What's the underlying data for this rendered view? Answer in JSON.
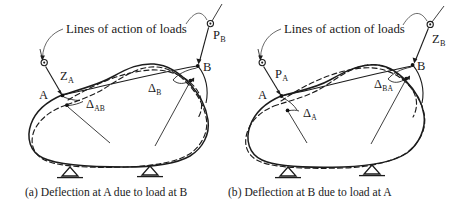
{
  "figure": {
    "kind": "engineering-diagram",
    "topic": "Maxwell's reciprocal theorem / Betti's law — deflection reciprocity",
    "background_color": "#ffffff",
    "ink_color": "#1c1c1c",
    "panels": [
      {
        "id": "a",
        "caption": "(a) Deflection at A due to load at B",
        "annotation_header": "Lines of action of loads",
        "labels": {
          "point_a": "A",
          "point_b": "B",
          "force_left_base": "Z",
          "force_left_sub": "A",
          "force_right_base": "P",
          "force_right_sub": "B",
          "deflection_left_base": "Δ",
          "deflection_left_sub": "AB",
          "deflection_right_base": "Δ",
          "deflection_right_sub": "B"
        },
        "legend": {
          "solid": "undeformed body outline",
          "dashed": "deformed body outline"
        },
        "supports": 2
      },
      {
        "id": "b",
        "caption": "(b) Deflection at B due to load at A",
        "annotation_header": "Lines of action of loads",
        "labels": {
          "point_a": "A",
          "point_b": "B",
          "force_left_base": "P",
          "force_left_sub": "A",
          "force_right_base": "Z",
          "force_right_sub": "B",
          "deflection_left_base": "Δ",
          "deflection_left_sub": "A",
          "deflection_right_base": "Δ",
          "deflection_right_sub": "BA"
        },
        "legend": {
          "solid": "undeformed body outline",
          "dashed": "deformed body outline"
        },
        "supports": 2
      }
    ]
  }
}
